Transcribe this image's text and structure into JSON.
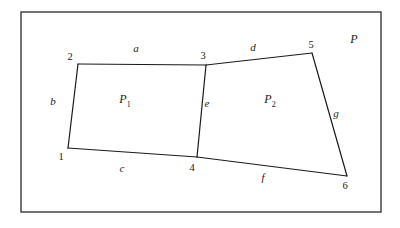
{
  "figure": {
    "border": {
      "x": 21,
      "y": 12,
      "width": 360,
      "height": 200,
      "color": "#3a3a3a"
    },
    "stroke_color": "#1a1a1a",
    "background": "#ffffff",
    "vertices": [
      {
        "id": "1",
        "label": "1",
        "x": 68,
        "y": 148,
        "label_x": 61,
        "label_y": 157
      },
      {
        "id": "2",
        "label": "2",
        "x": 78,
        "y": 64,
        "label_x": 70,
        "label_y": 57
      },
      {
        "id": "3",
        "label": "3",
        "x": 206,
        "y": 65,
        "label_x": 203,
        "label_y": 56
      },
      {
        "id": "4",
        "label": "4",
        "x": 197,
        "y": 157,
        "label_x": 192,
        "label_y": 168
      },
      {
        "id": "5",
        "label": "5",
        "x": 312,
        "y": 53,
        "label_x": 311,
        "label_y": 45
      },
      {
        "id": "6",
        "label": "6",
        "x": 347,
        "y": 176,
        "label_x": 345,
        "label_y": 186
      }
    ],
    "edges": [
      {
        "id": "a",
        "label": "a",
        "from": "2",
        "to": "3",
        "label_x": 136,
        "label_y": 48
      },
      {
        "id": "b",
        "label": "b",
        "from": "1",
        "to": "2",
        "label_x": 53,
        "label_y": 101
      },
      {
        "id": "c",
        "label": "c",
        "from": "1",
        "to": "4",
        "label_x": 122,
        "label_y": 168
      },
      {
        "id": "d",
        "label": "d",
        "from": "3",
        "to": "5",
        "label_x": 253,
        "label_y": 47
      },
      {
        "id": "e",
        "label": "e",
        "from": "3",
        "to": "4",
        "label_x": 207,
        "label_y": 103
      },
      {
        "id": "f",
        "label": "f",
        "from": "4",
        "to": "6",
        "label_x": 263,
        "label_y": 177
      },
      {
        "id": "g",
        "label": "g",
        "from": "5",
        "to": "6",
        "label_x": 336,
        "label_y": 113
      }
    ],
    "regions": [
      {
        "id": "P1",
        "letter": "P",
        "subscript": "1",
        "x": 125,
        "y": 101
      },
      {
        "id": "P2",
        "letter": "P",
        "subscript": "2",
        "x": 270,
        "y": 101
      }
    ],
    "outer_region": {
      "id": "P",
      "label": "P",
      "x": 354,
      "y": 39
    }
  }
}
